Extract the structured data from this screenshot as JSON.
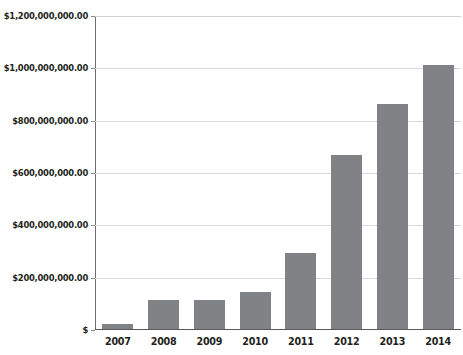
{
  "chart_data": {
    "type": "bar",
    "title": "",
    "xlabel": "",
    "ylabel": "",
    "categories": [
      "2007",
      "2008",
      "2009",
      "2010",
      "2011",
      "2012",
      "2013",
      "2014"
    ],
    "values": [
      18000000,
      110000000,
      110000000,
      140000000,
      290000000,
      665000000,
      860000000,
      1010000000
    ],
    "ylim": [
      0,
      1200000000
    ],
    "ytick_values": [
      0,
      200000000,
      400000000,
      600000000,
      800000000,
      1000000000,
      1200000000
    ],
    "ytick_labels": [
      "$",
      "$200,000,000.00",
      "$400,000,000.00",
      "$600,000,000.00",
      "$800,000,000.00",
      "$1,000,000,000.00",
      "$1,200,000,000.00"
    ],
    "grid": true,
    "legend": null,
    "legend_position": "none",
    "series_color": "#808285",
    "gridline_color": "#d9d9d9",
    "axis_color": "#58595b",
    "text_color": "#231f20"
  },
  "clipped_top_text": "$",
  "axis": {
    "y_top_label": "$1,200,000,000.00",
    "y_zero_label": "$"
  }
}
